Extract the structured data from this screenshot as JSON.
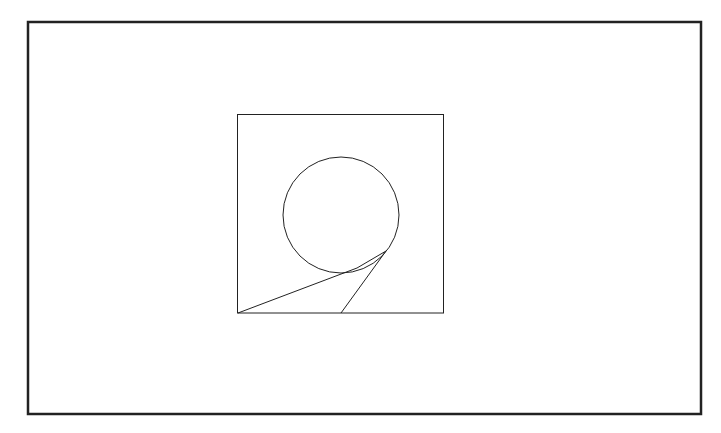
{
  "diagram": {
    "background": "#ffffff",
    "stroke_color": "#222222",
    "outer_frame": {
      "x": 28,
      "y": 22,
      "width": 673,
      "height": 392,
      "stroke_width": 2.5
    },
    "inner_box": {
      "x": 237.5,
      "y": 114.5,
      "width": 206,
      "height": 198.5,
      "stroke_width": 1
    },
    "circle": {
      "cx": 341,
      "cy": 215,
      "r": 58,
      "stroke_width": 1
    },
    "lines": [
      {
        "name": "left-tangent-line",
        "x1": 238,
        "y1": 313,
        "x2": 357,
        "y2": 268
      },
      {
        "name": "right-tangent-line",
        "x1": 341,
        "y1": 313,
        "x2": 386,
        "y2": 251
      },
      {
        "name": "arc-bridge-line",
        "x1": 357,
        "y1": 268,
        "x2": 386,
        "y2": 251
      }
    ]
  }
}
